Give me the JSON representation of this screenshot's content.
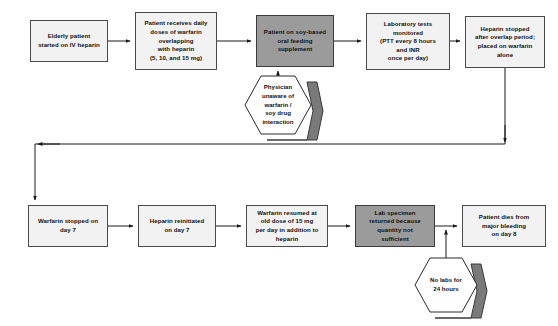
{
  "diagram": {
    "colors": {
      "box_fill": "#f2f2f2",
      "box_fill_highlight": "#9b9b9b",
      "border": "#4a4a4a",
      "hex_fill": "#ffffff",
      "hex_shadow": "#7a7a7a",
      "edge": "#1a1a1a",
      "text": "#111111"
    },
    "row1": [
      {
        "id": "node-elderly-patient",
        "label": "Elderly patient\nstarted on IV heparin",
        "highlight": false,
        "x": 30,
        "y": 20,
        "w": 78,
        "h": 42
      },
      {
        "id": "node-warfarin-doses",
        "label": "Patient receives daily\ndoses of warfarin\noverlapping\nwith heparin\n(5, 10, and 15 mg)",
        "highlight": false,
        "x": 135,
        "y": 12,
        "w": 82,
        "h": 58
      },
      {
        "id": "node-soy-feeding",
        "label": "Patient on soy-based\noral feeding\nsupplement",
        "highlight": true,
        "x": 256,
        "y": 15,
        "w": 78,
        "h": 52
      },
      {
        "id": "node-lab-tests",
        "label": "Laboratory  tests\nmonitored\n(PTT every 8 hours\nand INR\nonce per day)",
        "highlight": false,
        "x": 366,
        "y": 13,
        "w": 84,
        "h": 57
      },
      {
        "id": "node-heparin-stopped",
        "label": "Heparin stopped\nafter overlap period;\nplaced on warfarin\nalone",
        "highlight": false,
        "x": 465,
        "y": 16,
        "w": 80,
        "h": 52
      }
    ],
    "row2": [
      {
        "id": "node-warfarin-stopped",
        "label": "Warfarin stopped on\nday 7",
        "highlight": false,
        "x": 28,
        "y": 205,
        "w": 80,
        "h": 42
      },
      {
        "id": "node-heparin-reinitiated",
        "label": "Heparin reinitiated\non day 7",
        "highlight": false,
        "x": 138,
        "y": 205,
        "w": 78,
        "h": 42
      },
      {
        "id": "node-warfarin-resumed",
        "label": "Warfarin resumed at\nold dose of 15 mg\nper day in addition to\nheparin",
        "highlight": false,
        "x": 246,
        "y": 205,
        "w": 82,
        "h": 42
      },
      {
        "id": "node-lab-specimen",
        "label": "Lab specimen\nreturned because\nquantity not\nsufficient",
        "highlight": true,
        "x": 355,
        "y": 205,
        "w": 80,
        "h": 42
      },
      {
        "id": "node-patient-dies",
        "label": "Patient dies from\nmajor bleeding\non day 8",
        "highlight": false,
        "x": 462,
        "y": 205,
        "w": 84,
        "h": 42
      }
    ],
    "hexagons": [
      {
        "id": "hex-physician-unaware",
        "label": "Physician\nunaware of\nwarfarin /\nsoy drug\ninteraction",
        "x": 245,
        "y": 76,
        "w": 66,
        "h": 58
      },
      {
        "id": "hex-no-labs",
        "label": "No labs for\n24 hours",
        "x": 415,
        "y": 258,
        "w": 62,
        "h": 54
      }
    ],
    "edges": [
      {
        "id": "edge-elderly-to-doses",
        "kind": "arrow-right"
      },
      {
        "id": "edge-doses-to-soy",
        "kind": "arrow-right"
      },
      {
        "id": "edge-soy-to-labtests",
        "kind": "arrow-right"
      },
      {
        "id": "edge-labtests-to-heparinstopped",
        "kind": "arrow-right"
      },
      {
        "id": "edge-physician-to-soy",
        "kind": "arrow-up"
      },
      {
        "id": "edge-heparinstopped-to-warfarinstopped",
        "kind": "wrap-around"
      },
      {
        "id": "edge-warfarinstopped-to-reinitiated",
        "kind": "arrow-right"
      },
      {
        "id": "edge-reinitiated-to-resumed",
        "kind": "arrow-right"
      },
      {
        "id": "edge-resumed-to-specimen",
        "kind": "arrow-right"
      },
      {
        "id": "edge-specimen-to-dies",
        "kind": "arrow-right"
      },
      {
        "id": "edge-nolabs-to-junction",
        "kind": "arrow-up"
      }
    ]
  }
}
